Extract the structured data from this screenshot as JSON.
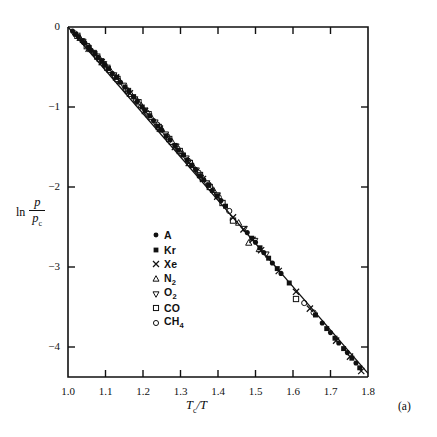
{
  "figure": {
    "panel_label": "(a)",
    "background_color": "#ffffff",
    "ink_color": "#111111"
  },
  "chart_data": {
    "type": "scatter",
    "title": "",
    "subtitle": "",
    "xlabel": "Tc/T",
    "xlabel_parts": {
      "main": "T",
      "sub": "c",
      "tail": "/T"
    },
    "ylabel": "ln p/pc",
    "ylabel_parts": {
      "ln": "ln",
      "numerator": "p",
      "denominator": "p",
      "denominator_sub": "c"
    },
    "xlim": [
      1.0,
      1.8
    ],
    "ylim": [
      -4.375,
      0.0
    ],
    "xticks": [
      1.0,
      1.1,
      1.2,
      1.3,
      1.4,
      1.5,
      1.6,
      1.7,
      1.8
    ],
    "xtick_labels": [
      "1.0",
      "1.1",
      "1.2",
      "1.3",
      "1.4",
      "1.5",
      "1.6",
      "1.7",
      "1.8"
    ],
    "yticks": [
      0,
      -1,
      -2,
      -3,
      -4
    ],
    "ytick_labels": [
      "0",
      "−1",
      "−2",
      "−3",
      "−4"
    ],
    "grid": false,
    "legend_position": "center-left-inside",
    "fit_line": {
      "label": "corresponding-states line",
      "x": [
        1.0,
        1.8
      ],
      "y": [
        0.0,
        -4.33
      ]
    },
    "series": [
      {
        "name": "A",
        "marker": "filled-circle",
        "points": [
          [
            1.012,
            -0.05
          ],
          [
            1.028,
            -0.12
          ],
          [
            1.045,
            -0.2
          ],
          [
            1.062,
            -0.29
          ],
          [
            1.08,
            -0.38
          ],
          [
            1.098,
            -0.47
          ],
          [
            1.118,
            -0.58
          ],
          [
            1.14,
            -0.69
          ],
          [
            1.162,
            -0.8
          ],
          [
            1.185,
            -0.93
          ],
          [
            1.205,
            -1.04
          ],
          [
            1.228,
            -1.17
          ],
          [
            1.25,
            -1.29
          ],
          [
            1.272,
            -1.41
          ],
          [
            1.295,
            -1.54
          ],
          [
            1.318,
            -1.66
          ],
          [
            1.34,
            -1.78
          ],
          [
            1.362,
            -1.91
          ],
          [
            1.385,
            -2.04
          ],
          [
            1.408,
            -2.17
          ],
          [
            1.478,
            -2.57
          ],
          [
            1.5,
            -2.69
          ],
          [
            1.522,
            -2.82
          ],
          [
            1.545,
            -2.95
          ],
          [
            1.568,
            -3.08
          ],
          [
            1.678,
            -3.7
          ],
          [
            1.7,
            -3.82
          ],
          [
            1.722,
            -3.95
          ],
          [
            1.745,
            -4.07
          ],
          [
            1.768,
            -4.2
          ]
        ]
      },
      {
        "name": "Kr",
        "marker": "filled-square",
        "points": [
          [
            1.02,
            -0.09
          ],
          [
            1.038,
            -0.17
          ],
          [
            1.055,
            -0.25
          ],
          [
            1.072,
            -0.33
          ],
          [
            1.09,
            -0.42
          ],
          [
            1.108,
            -0.52
          ],
          [
            1.13,
            -0.63
          ],
          [
            1.152,
            -0.75
          ],
          [
            1.175,
            -0.87
          ],
          [
            1.198,
            -1.0
          ],
          [
            1.218,
            -1.11
          ],
          [
            1.24,
            -1.24
          ],
          [
            1.262,
            -1.36
          ],
          [
            1.285,
            -1.48
          ],
          [
            1.308,
            -1.6
          ],
          [
            1.33,
            -1.73
          ],
          [
            1.352,
            -1.86
          ],
          [
            1.375,
            -1.98
          ],
          [
            1.398,
            -2.11
          ],
          [
            1.42,
            -2.24
          ],
          [
            1.49,
            -2.64
          ],
          [
            1.512,
            -2.76
          ],
          [
            1.535,
            -2.89
          ],
          [
            1.558,
            -3.02
          ],
          [
            1.59,
            -3.2
          ],
          [
            1.66,
            -3.6
          ],
          [
            1.69,
            -3.77
          ],
          [
            1.712,
            -3.89
          ],
          [
            1.735,
            -4.02
          ],
          [
            1.757,
            -4.14
          ],
          [
            1.778,
            -4.26
          ]
        ]
      },
      {
        "name": "Xe",
        "marker": "cross",
        "points": [
          [
            1.055,
            -0.27
          ],
          [
            1.09,
            -0.44
          ],
          [
            1.128,
            -0.63
          ],
          [
            1.165,
            -0.83
          ],
          [
            1.205,
            -1.05
          ],
          [
            1.245,
            -1.27
          ],
          [
            1.285,
            -1.5
          ],
          [
            1.322,
            -1.7
          ],
          [
            1.36,
            -1.9
          ],
          [
            1.398,
            -2.12
          ],
          [
            1.44,
            -2.38
          ],
          [
            1.468,
            -2.53
          ],
          [
            1.492,
            -2.66
          ],
          [
            1.515,
            -2.79
          ],
          [
            1.562,
            -3.05
          ],
          [
            1.608,
            -3.31
          ],
          [
            1.645,
            -3.52
          ],
          [
            1.715,
            -3.92
          ],
          [
            1.752,
            -4.12
          ],
          [
            1.782,
            -4.3
          ]
        ]
      },
      {
        "name": "N2",
        "marker": "open-triangle-up",
        "points": [
          [
            1.032,
            -0.14
          ],
          [
            1.06,
            -0.28
          ],
          [
            1.085,
            -0.4
          ],
          [
            1.112,
            -0.54
          ],
          [
            1.138,
            -0.68
          ],
          [
            1.168,
            -0.84
          ],
          [
            1.195,
            -0.98
          ],
          [
            1.222,
            -1.13
          ],
          [
            1.25,
            -1.28
          ],
          [
            1.278,
            -1.44
          ],
          [
            1.305,
            -1.58
          ],
          [
            1.332,
            -1.73
          ],
          [
            1.36,
            -1.89
          ],
          [
            1.388,
            -2.04
          ],
          [
            1.455,
            -2.45
          ],
          [
            1.482,
            -2.7
          ],
          [
            1.51,
            -2.78
          ]
        ]
      },
      {
        "name": "O2",
        "marker": "open-triangle-down",
        "points": [
          [
            1.04,
            -0.18
          ],
          [
            1.068,
            -0.32
          ],
          [
            1.095,
            -0.46
          ],
          [
            1.122,
            -0.6
          ],
          [
            1.148,
            -0.73
          ],
          [
            1.178,
            -0.9
          ],
          [
            1.205,
            -1.04
          ],
          [
            1.232,
            -1.19
          ],
          [
            1.26,
            -1.34
          ],
          [
            1.288,
            -1.49
          ],
          [
            1.315,
            -1.64
          ],
          [
            1.342,
            -1.79
          ],
          [
            1.37,
            -1.95
          ],
          [
            1.398,
            -2.1
          ],
          [
            1.47,
            -2.52
          ],
          [
            1.498,
            -2.67
          ],
          [
            1.528,
            -2.84
          ]
        ]
      },
      {
        "name": "CO",
        "marker": "open-square",
        "points": [
          [
            1.025,
            -0.11
          ],
          [
            1.05,
            -0.24
          ],
          [
            1.078,
            -0.37
          ],
          [
            1.105,
            -0.51
          ],
          [
            1.132,
            -0.65
          ],
          [
            1.16,
            -0.8
          ],
          [
            1.188,
            -0.94
          ],
          [
            1.215,
            -1.09
          ],
          [
            1.242,
            -1.25
          ],
          [
            1.27,
            -1.4
          ],
          [
            1.298,
            -1.55
          ],
          [
            1.325,
            -1.7
          ],
          [
            1.352,
            -1.85
          ],
          [
            1.378,
            -2.0
          ],
          [
            1.412,
            -2.2
          ],
          [
            1.44,
            -2.42
          ],
          [
            1.608,
            -3.4
          ]
        ]
      },
      {
        "name": "CH4",
        "marker": "open-circle",
        "points": [
          [
            1.018,
            -0.08
          ],
          [
            1.042,
            -0.19
          ],
          [
            1.07,
            -0.33
          ],
          [
            1.098,
            -0.48
          ],
          [
            1.125,
            -0.62
          ],
          [
            1.155,
            -0.78
          ],
          [
            1.182,
            -0.92
          ],
          [
            1.21,
            -1.07
          ],
          [
            1.238,
            -1.22
          ],
          [
            1.265,
            -1.37
          ],
          [
            1.292,
            -1.52
          ],
          [
            1.32,
            -1.67
          ],
          [
            1.348,
            -1.82
          ],
          [
            1.375,
            -1.97
          ],
          [
            1.402,
            -2.13
          ],
          [
            1.43,
            -2.3
          ],
          [
            1.63,
            -3.45
          ],
          [
            1.655,
            -3.57
          ]
        ]
      }
    ]
  },
  "legend": {
    "items": [
      {
        "label": "A",
        "label_sub": "",
        "marker": "filled-circle"
      },
      {
        "label": "Kr",
        "label_sub": "",
        "marker": "filled-square"
      },
      {
        "label": "Xe",
        "label_sub": "",
        "marker": "cross"
      },
      {
        "label": "N",
        "label_sub": "2",
        "marker": "open-triangle-up"
      },
      {
        "label": "O",
        "label_sub": "2",
        "marker": "open-triangle-down"
      },
      {
        "label": "CO",
        "label_sub": "",
        "marker": "open-square"
      },
      {
        "label": "CH",
        "label_sub": "4",
        "marker": "open-circle"
      }
    ]
  }
}
